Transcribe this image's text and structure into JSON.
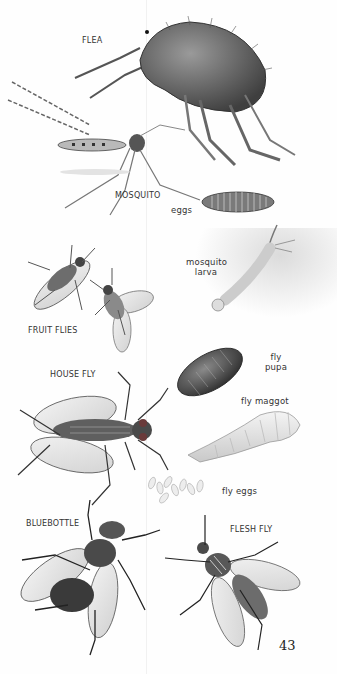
{
  "page": {
    "number": "43",
    "background": "#fefefe"
  },
  "labels": {
    "flea": "FLEA",
    "mosquito": "MOSQUITO",
    "mosquito_eggs": "eggs",
    "mosquito_larva_line1": "mosquito",
    "mosquito_larva_line2": "larva",
    "fruit_flies": "FRUIT FLIES",
    "house_fly": "HOUSE FLY",
    "fly_pupa_line1": "fly",
    "fly_pupa_line2": "pupa",
    "fly_maggot": "fly maggot",
    "fly_eggs": "fly eggs",
    "bluebottle": "BLUEBOTTLE",
    "flesh_fly": "FLESH FLY"
  },
  "illustrations": [
    {
      "name": "flea",
      "icon": "flea-illustration"
    },
    {
      "name": "mosquito",
      "icon": "mosquito-illustration"
    },
    {
      "name": "mosquito-eggs",
      "icon": "egg-raft-illustration"
    },
    {
      "name": "mosquito-larva",
      "icon": "larva-illustration"
    },
    {
      "name": "fruit-flies",
      "icon": "fruit-fly-illustration"
    },
    {
      "name": "house-fly",
      "icon": "house-fly-illustration"
    },
    {
      "name": "fly-pupa",
      "icon": "pupa-illustration"
    },
    {
      "name": "fly-maggot",
      "icon": "maggot-illustration"
    },
    {
      "name": "fly-eggs",
      "icon": "eggs-illustration"
    },
    {
      "name": "bluebottle",
      "icon": "bluebottle-illustration"
    },
    {
      "name": "flesh-fly",
      "icon": "flesh-fly-illustration"
    }
  ]
}
